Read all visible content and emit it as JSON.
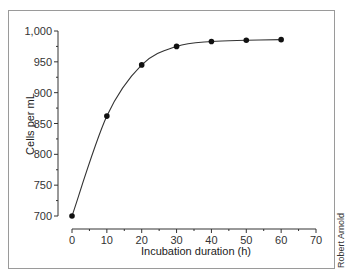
{
  "chart_data": {
    "type": "line",
    "title": "",
    "xlabel": "Incubation duration (h)",
    "ylabel": "Cells per mL",
    "x": [
      0,
      10,
      20,
      30,
      40,
      50,
      60
    ],
    "series": [
      {
        "name": "Cells per mL",
        "values": [
          700,
          862,
          945,
          975,
          983,
          985,
          986
        ]
      }
    ],
    "xlim": [
      0,
      70
    ],
    "ylim": [
      700,
      1000
    ],
    "x_ticks": [
      "0",
      "10",
      "20",
      "30",
      "40",
      "50",
      "60",
      "70"
    ],
    "y_ticks": [
      "700",
      "750",
      "800",
      "850",
      "900",
      "950",
      "1,000"
    ],
    "grid": false,
    "legend": "none",
    "marker": "filled-circle",
    "line_style": "smooth-curve"
  },
  "credit": "Robert Arnold"
}
